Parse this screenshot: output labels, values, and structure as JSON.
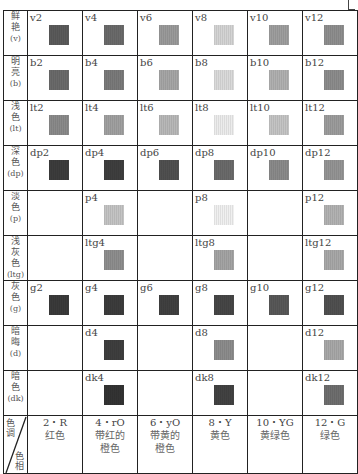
{
  "table": {
    "corner_header": {
      "top": "色调",
      "bottom": "色相"
    },
    "hues": [
      {
        "code": "2・R",
        "name": "红色"
      },
      {
        "code": "4・rO",
        "name": "带红的\n橙色"
      },
      {
        "code": "6・yO",
        "name": "带黄的\n橙色"
      },
      {
        "code": "8・Y",
        "name": "黄色"
      },
      {
        "code": "10・YG",
        "name": "黄绿色"
      },
      {
        "code": "12・G",
        "name": "绿色"
      }
    ],
    "rows": [
      {
        "tone": "鲜艳",
        "abbr": "(v)",
        "cells": [
          {
            "code": "v2",
            "color": "#5a5a5a"
          },
          {
            "code": "v4",
            "color": "#6a6a6a"
          },
          {
            "code": "v6",
            "color": "#9a9a9a"
          },
          {
            "code": "v8",
            "color": "#d4d4d4"
          },
          {
            "code": "v10",
            "color": "#9e9e9e"
          },
          {
            "code": "v12",
            "color": "#8e8e8e"
          }
        ]
      },
      {
        "tone": "明亮",
        "abbr": "(b)",
        "cells": [
          {
            "code": "b2",
            "color": "#6a6a6a"
          },
          {
            "code": "b4",
            "color": "#7a7a7a"
          },
          {
            "code": "b6",
            "color": "#a6a6a6"
          },
          {
            "code": "b8",
            "color": "#dadada"
          },
          {
            "code": "b10",
            "color": "#b0b0b0"
          },
          {
            "code": "b12",
            "color": "#8c8c8c"
          }
        ]
      },
      {
        "tone": "浅色",
        "abbr": "(lt)",
        "cells": [
          {
            "code": "lt2",
            "color": "#8a8a8a"
          },
          {
            "code": "lt4",
            "color": "#a0a0a0"
          },
          {
            "code": "lt6",
            "color": "#b8b8b8"
          },
          {
            "code": "lt8",
            "color": "#ececec"
          },
          {
            "code": "lt10",
            "color": "#c4c4c4"
          },
          {
            "code": "lt12",
            "color": "#9c9c9c"
          }
        ]
      },
      {
        "tone": "深色",
        "abbr": "(dp)",
        "cells": [
          {
            "code": "dp2",
            "color": "#3c3c3c"
          },
          {
            "code": "dp4",
            "color": "#3e3e3e"
          },
          {
            "code": "dp6",
            "color": "#505050"
          },
          {
            "code": "dp8",
            "color": "#6a6a6a"
          },
          {
            "code": "dp10",
            "color": "#8a8a8a"
          },
          {
            "code": "dp12",
            "color": "#949494"
          }
        ]
      },
      {
        "tone": "淡色",
        "abbr": "(p)",
        "cells": [
          {
            "code": "",
            "color": ""
          },
          {
            "code": "p4",
            "color": "#c4c4c4"
          },
          {
            "code": "",
            "color": ""
          },
          {
            "code": "p8",
            "color": "#f0f0f0"
          },
          {
            "code": "",
            "color": ""
          },
          {
            "code": "p12",
            "color": "#b2b2b2"
          }
        ]
      },
      {
        "tone": "浅灰色",
        "abbr": "(ltg)",
        "cells": [
          {
            "code": "",
            "color": ""
          },
          {
            "code": "ltg4",
            "color": "#8e8e8e"
          },
          {
            "code": "",
            "color": ""
          },
          {
            "code": "ltg8",
            "color": "#a4a4a4"
          },
          {
            "code": "",
            "color": ""
          },
          {
            "code": "ltg12",
            "color": "#a8a8a8"
          }
        ]
      },
      {
        "tone": "灰色",
        "abbr": "(g)",
        "cells": [
          {
            "code": "g2",
            "color": "#3a3a3a"
          },
          {
            "code": "g4",
            "color": "#3c3c3c"
          },
          {
            "code": "g6",
            "color": "#404040"
          },
          {
            "code": "g8",
            "color": "#464646"
          },
          {
            "code": "g10",
            "color": "#585858"
          },
          {
            "code": "g12",
            "color": "#505050"
          }
        ]
      },
      {
        "tone": "暗晦",
        "abbr": "(d)",
        "cells": [
          {
            "code": "",
            "color": ""
          },
          {
            "code": "d4",
            "color": "#3e3e3e"
          },
          {
            "code": "",
            "color": ""
          },
          {
            "code": "d8",
            "color": "#8c8c8c"
          },
          {
            "code": "",
            "color": ""
          },
          {
            "code": "d12",
            "color": "#a8a8a8"
          }
        ]
      },
      {
        "tone": "暗色",
        "abbr": "(dk)",
        "cells": [
          {
            "code": "",
            "color": ""
          },
          {
            "code": "dk4",
            "color": "#333333"
          },
          {
            "code": "",
            "color": ""
          },
          {
            "code": "dk8",
            "color": "#424242"
          },
          {
            "code": "",
            "color": ""
          },
          {
            "code": "dk12",
            "color": "#6e6e6e"
          }
        ]
      }
    ]
  }
}
